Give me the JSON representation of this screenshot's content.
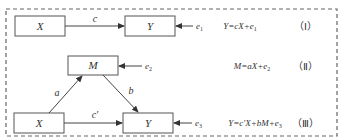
{
  "diagram": {
    "model1": {
      "nodes": [
        {
          "id": "X",
          "label": "X"
        },
        {
          "id": "Y",
          "label": "Y"
        }
      ],
      "edges": [
        {
          "from": "X",
          "to": "Y",
          "label": "c"
        }
      ],
      "error": {
        "label": "e",
        "sub": "1"
      },
      "equation": {
        "lhs": "Y=cX+e",
        "sub": "1"
      },
      "number": "（Ⅰ）"
    },
    "model2": {
      "nodes": [
        {
          "id": "M",
          "label": "M"
        }
      ],
      "error": {
        "label": "e",
        "sub": "2"
      },
      "equation": {
        "lhs": "M=aX+e",
        "sub": "2"
      },
      "number": "（Ⅱ）"
    },
    "model3": {
      "nodes": [
        {
          "id": "X",
          "label": "X"
        },
        {
          "id": "Y",
          "label": "Y"
        }
      ],
      "edges": [
        {
          "from": "X",
          "to": "M",
          "label": "a"
        },
        {
          "from": "M",
          "to": "Y",
          "label": "b"
        },
        {
          "from": "X",
          "to": "Y",
          "label": "c′"
        }
      ],
      "error": {
        "label": "e",
        "sub": "3"
      },
      "equation": {
        "lhs": "Y=c′X+bM+e",
        "sub": "3"
      },
      "number": "（Ⅲ）"
    }
  }
}
